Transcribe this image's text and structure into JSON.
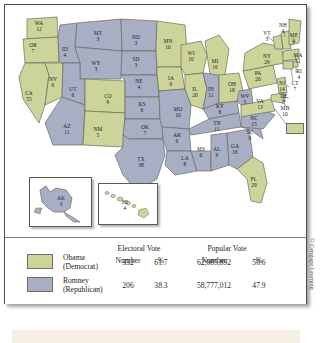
{
  "figure": {
    "credit": "© Cengage Learning"
  },
  "legend": {
    "group_headers": [
      "Electoral Vote",
      "Popular Vote"
    ],
    "col_headers": [
      "Number",
      "%",
      "Number",
      "%"
    ],
    "rows": [
      {
        "candidate": "Obama",
        "party": "(Democrat)",
        "color": "#ccd49a",
        "electoral_number": "332",
        "electoral_pct": "61.7",
        "popular_number": "62,085,892",
        "popular_pct": "50.6"
      },
      {
        "candidate": "Romney",
        "party": "(Republican)",
        "color": "#a8aec4",
        "electoral_number": "206",
        "electoral_pct": "38.3",
        "popular_number": "58,777,012",
        "popular_pct": "47.9"
      }
    ]
  },
  "map": {
    "colors": {
      "obama": "#ccd49a",
      "romney": "#a8aec4",
      "border": "#6b6b60",
      "water": "#ffffff"
    },
    "dc": {
      "abbr": "DC",
      "votes": "3",
      "winner": "obama"
    },
    "insets": [
      {
        "name": "alaska",
        "abbr": "AK",
        "votes": "3",
        "winner": "romney"
      },
      {
        "name": "hawaii",
        "abbr": "HI",
        "votes": "4",
        "winner": "obama"
      }
    ],
    "states": [
      {
        "abbr": "WA",
        "votes": "12",
        "winner": "obama",
        "x": 34,
        "y": 22
      },
      {
        "abbr": "OR",
        "votes": "7",
        "winner": "obama",
        "x": 28,
        "y": 44
      },
      {
        "abbr": "CA",
        "votes": "55",
        "winner": "obama",
        "x": 24,
        "y": 92
      },
      {
        "abbr": "NV",
        "votes": "6",
        "winner": "obama",
        "x": 48,
        "y": 78
      },
      {
        "abbr": "ID",
        "votes": "4",
        "winner": "romney",
        "x": 60,
        "y": 48
      },
      {
        "abbr": "MT",
        "votes": "3",
        "winner": "romney",
        "x": 93,
        "y": 32
      },
      {
        "abbr": "WY",
        "votes": "3",
        "winner": "romney",
        "x": 91,
        "y": 62
      },
      {
        "abbr": "UT",
        "votes": "6",
        "winner": "romney",
        "x": 68,
        "y": 88
      },
      {
        "abbr": "AZ",
        "votes": "11",
        "winner": "romney",
        "x": 62,
        "y": 125
      },
      {
        "abbr": "CO",
        "votes": "9",
        "winner": "obama",
        "x": 103,
        "y": 95
      },
      {
        "abbr": "NM",
        "votes": "5",
        "winner": "obama",
        "x": 93,
        "y": 128
      },
      {
        "abbr": "ND",
        "votes": "3",
        "winner": "romney",
        "x": 131,
        "y": 36
      },
      {
        "abbr": "SD",
        "votes": "3",
        "winner": "romney",
        "x": 131,
        "y": 58
      },
      {
        "abbr": "NE",
        "votes": "4",
        "winner": "romney",
        "x": 134,
        "y": 80
      },
      {
        "abbr": "KS",
        "votes": "6",
        "winner": "romney",
        "x": 137,
        "y": 103
      },
      {
        "abbr": "OK",
        "votes": "7",
        "winner": "romney",
        "x": 140,
        "y": 126
      },
      {
        "abbr": "TX",
        "votes": "38",
        "winner": "romney",
        "x": 136,
        "y": 158
      },
      {
        "abbr": "MN",
        "votes": "10",
        "winner": "obama",
        "x": 163,
        "y": 40
      },
      {
        "abbr": "IA",
        "votes": "6",
        "winner": "obama",
        "x": 166,
        "y": 77
      },
      {
        "abbr": "MO",
        "votes": "10",
        "winner": "romney",
        "x": 173,
        "y": 108
      },
      {
        "abbr": "AR",
        "votes": "6",
        "winner": "romney",
        "x": 172,
        "y": 134
      },
      {
        "abbr": "LA",
        "votes": "8",
        "winner": "romney",
        "x": 180,
        "y": 157
      },
      {
        "abbr": "WI",
        "votes": "10",
        "winner": "obama",
        "x": 186,
        "y": 52
      },
      {
        "abbr": "IL",
        "votes": "20",
        "winner": "obama",
        "x": 190,
        "y": 88
      },
      {
        "abbr": "MS",
        "votes": "6",
        "winner": "romney",
        "x": 196,
        "y": 148
      },
      {
        "abbr": "MI",
        "votes": "16",
        "winner": "obama",
        "x": 210,
        "y": 60
      },
      {
        "abbr": "IN",
        "votes": "11",
        "winner": "romney",
        "x": 206,
        "y": 88
      },
      {
        "abbr": "KY",
        "votes": "8",
        "winner": "romney",
        "x": 215,
        "y": 105
      },
      {
        "abbr": "TN",
        "votes": "11",
        "winner": "romney",
        "x": 212,
        "y": 122
      },
      {
        "abbr": "AL",
        "votes": "9",
        "winner": "romney",
        "x": 212,
        "y": 148
      },
      {
        "abbr": "OH",
        "votes": "18",
        "winner": "obama",
        "x": 227,
        "y": 83
      },
      {
        "abbr": "GA",
        "votes": "16",
        "winner": "romney",
        "x": 230,
        "y": 145
      },
      {
        "abbr": "FL",
        "votes": "29",
        "winner": "obama",
        "x": 249,
        "y": 178
      },
      {
        "abbr": "SC",
        "votes": "9",
        "winner": "romney",
        "x": 245,
        "y": 131
      },
      {
        "abbr": "NC",
        "votes": "15",
        "winner": "romney",
        "x": 249,
        "y": 117
      },
      {
        "abbr": "WV",
        "votes": "5",
        "winner": "romney",
        "x": 240,
        "y": 95
      },
      {
        "abbr": "VA",
        "votes": "13",
        "winner": "obama",
        "x": 255,
        "y": 100
      },
      {
        "abbr": "PA",
        "votes": "20",
        "winner": "obama",
        "x": 253,
        "y": 72
      },
      {
        "abbr": "NY",
        "votes": "29",
        "winner": "obama",
        "x": 262,
        "y": 55
      },
      {
        "abbr": "VT",
        "votes": "3",
        "winner": "obama",
        "x": 262,
        "y": 32
      },
      {
        "abbr": "NH",
        "votes": "4",
        "winner": "obama",
        "x": 278,
        "y": 24
      },
      {
        "abbr": "ME",
        "votes": "4",
        "winner": "obama",
        "x": 289,
        "y": 34
      },
      {
        "abbr": "MA",
        "votes": "11",
        "winner": "obama",
        "x": 293,
        "y": 54
      },
      {
        "abbr": "RI",
        "votes": "4",
        "winner": "obama",
        "x": 294,
        "y": 70
      },
      {
        "abbr": "CT",
        "votes": "7",
        "winner": "obama",
        "x": 290,
        "y": 82
      },
      {
        "abbr": "NJ",
        "votes": "14",
        "winner": "obama",
        "x": 277,
        "y": 82
      },
      {
        "abbr": "DE",
        "votes": "3",
        "winner": "obama",
        "x": 279,
        "y": 95
      },
      {
        "abbr": "MD",
        "votes": "10",
        "winner": "obama",
        "x": 280,
        "y": 107
      }
    ]
  }
}
